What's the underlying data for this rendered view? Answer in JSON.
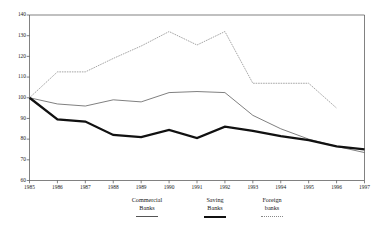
{
  "chart_data": {
    "type": "line",
    "title": "",
    "xlabel": "",
    "ylabel": "",
    "x": [
      1985,
      1986,
      1987,
      1988,
      1989,
      1990,
      1991,
      1992,
      1993,
      1994,
      1995,
      1996,
      1997
    ],
    "xticklabels": [
      "1985",
      "1986",
      "1987",
      "1988",
      "1989",
      "1990",
      "1991",
      "1992",
      "1993",
      "1994",
      "1995",
      "1996",
      "1997"
    ],
    "yticks": [
      60,
      70,
      80,
      90,
      100,
      110,
      120,
      130,
      140
    ],
    "yticklabels": [
      "60",
      "70",
      "80",
      "90",
      "100",
      "110",
      "120",
      "130",
      "140"
    ],
    "ylim": [
      60,
      140
    ],
    "xlim": [
      1985,
      1997
    ],
    "grid": false,
    "legend_position": "below",
    "series": [
      {
        "name": "Commercial Banks",
        "style": "thin-solid",
        "color": "#555555",
        "values": [
          100,
          97,
          96,
          99,
          98,
          102.5,
          103,
          102.5,
          91.5,
          85,
          80,
          76.5,
          73.5
        ]
      },
      {
        "name": "Saving Banks",
        "style": "thick-solid",
        "color": "#111111",
        "values": [
          100,
          89.5,
          88.5,
          82,
          81,
          84.5,
          80.5,
          86,
          84,
          81.5,
          79.5,
          76.5,
          75
        ]
      },
      {
        "name": "Foreign banks",
        "style": "dotted",
        "color": "#888888",
        "values": [
          100,
          112.5,
          112.5,
          119,
          125,
          132,
          125.5,
          132,
          107,
          107,
          107,
          95,
          null
        ]
      }
    ]
  },
  "legend": {
    "items": [
      {
        "line1": "Commercial",
        "line2": "Banks",
        "swatch": "thin-line-swatch"
      },
      {
        "line1": "Saving",
        "line2": "Banks",
        "swatch": "thick-line-swatch"
      },
      {
        "line1": "Foreign",
        "line2": "banks",
        "swatch": "dotted-line-swatch"
      }
    ]
  }
}
